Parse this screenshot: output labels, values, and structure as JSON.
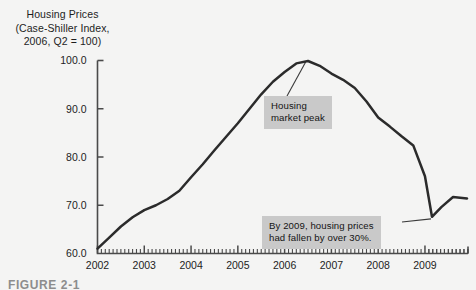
{
  "figure": {
    "caption": "FIGURE 2-1"
  },
  "title": {
    "line1": "Housing Prices",
    "line2": "(Case-Shiller Index,",
    "line3": "2006, Q2 = 100)"
  },
  "annotations": {
    "peak": {
      "line1": "Housing",
      "line2": "market peak"
    },
    "decline": {
      "line1": "By 2009, housing prices",
      "line2": "had fallen by over 30%."
    }
  },
  "colors": {
    "background": "#f4f4f3",
    "line": "#2b2b2b",
    "axis": "#4a4a4a",
    "callout_bg": "#c9c9c9",
    "text": "#1d1d1d"
  },
  "chart_data": {
    "type": "line",
    "title": "Housing Prices (Case-Shiller Index, 2006, Q2 = 100)",
    "xlabel": "",
    "ylabel": "Case-Shiller Index (2006, Q2 = 100)",
    "xlim": [
      2002.0,
      2009.92
    ],
    "ylim": [
      60.0,
      100.0
    ],
    "ytick_labels": [
      "60.0",
      "70.0",
      "80.0",
      "90.0",
      "100.0"
    ],
    "yticks": [
      60.0,
      70.0,
      80.0,
      90.0,
      100.0
    ],
    "xtick_labels": [
      "2002",
      "2003",
      "2004",
      "2005",
      "2006",
      "2007",
      "2008",
      "2009"
    ],
    "xticks": [
      2002,
      2003,
      2004,
      2005,
      2006,
      2007,
      2008,
      2009
    ],
    "minor_xticks_per_year": 12,
    "grid": false,
    "legend": null,
    "series": [
      {
        "name": "Case-Shiller Home Price Index",
        "x": [
          2002.0,
          2002.25,
          2002.5,
          2002.75,
          2003.0,
          2003.25,
          2003.5,
          2003.75,
          2004.0,
          2004.25,
          2004.5,
          2004.75,
          2005.0,
          2005.25,
          2005.5,
          2005.75,
          2006.0,
          2006.25,
          2006.5,
          2006.75,
          2007.0,
          2007.25,
          2007.5,
          2007.75,
          2008.0,
          2008.25,
          2008.5,
          2008.75,
          2009.0,
          2009.15,
          2009.35,
          2009.6,
          2009.9
        ],
        "y": [
          61.0,
          63.3,
          65.6,
          67.5,
          69.0,
          70.0,
          71.3,
          73.0,
          75.8,
          78.5,
          81.4,
          84.2,
          87.0,
          90.0,
          93.0,
          95.6,
          97.6,
          99.4,
          99.9,
          98.9,
          97.3,
          96.0,
          94.3,
          91.5,
          88.2,
          86.3,
          84.3,
          82.4,
          76.0,
          67.6,
          69.6,
          71.7,
          71.4
        ]
      }
    ],
    "annotations": [
      {
        "text": "Housing market peak",
        "points_to_x": 2006.45,
        "points_to_y": 99.9
      },
      {
        "text": "By 2009, housing prices had fallen by over 30%.",
        "points_to_x": 2009.15,
        "points_to_y": 67.6
      }
    ]
  }
}
